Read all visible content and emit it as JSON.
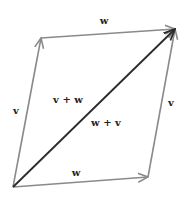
{
  "diagram": {
    "type": "vector-parallelogram",
    "colors": {
      "edge": "#8a8a8a",
      "diagonal": "#2a2a2a",
      "label": "#222222",
      "background": "#ffffff"
    },
    "points": {
      "origin": [
        13,
        187
      ],
      "v_tip": [
        41,
        38
      ],
      "w_tip": [
        148,
        177
      ],
      "sum_tip": [
        175,
        29
      ]
    },
    "labels": {
      "w_top": "w",
      "w_bottom": "w",
      "v_left": "v",
      "v_right": "v",
      "v_plus_w": "v + w",
      "w_plus_v": "w + v"
    }
  }
}
